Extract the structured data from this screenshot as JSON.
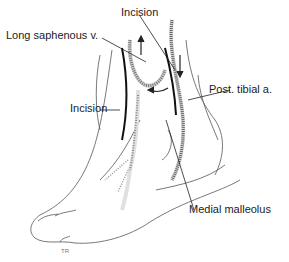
{
  "figure": {
    "labels": {
      "incision_top": "Incision",
      "long_saphenous": "Long saphenous v.",
      "incision_left": "Incision",
      "post_tibial": "Post. tibial a.",
      "medial_malleolus": "Medial malleolus"
    },
    "signature": "TR"
  },
  "colors": {
    "line": "#333333",
    "vessel": "#888888",
    "vessel_shade": "#d0d0d0",
    "text": "#222222"
  }
}
